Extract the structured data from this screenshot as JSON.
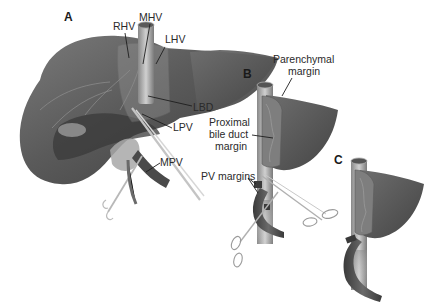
{
  "figure": {
    "panels": [
      {
        "id": "A",
        "label": "A",
        "labels": {
          "rhv": "RHV",
          "mhv": "MHV",
          "lhv": "LHV",
          "lbd": "LBD",
          "lpv": "LPV",
          "mpv": "MPV"
        }
      },
      {
        "id": "B",
        "label": "B",
        "labels": {
          "parenchymal_line1": "Parenchymal",
          "parenchymal_line2": "margin",
          "bile_line1": "Proximal",
          "bile_line2": "bile duct",
          "bile_line3": "margin",
          "pv_margins": "PV margins"
        }
      },
      {
        "id": "C",
        "label": "C"
      }
    ],
    "colors": {
      "liver_dark": "#4a4a4a",
      "liver_mid": "#6a6a6a",
      "liver_light": "#8c8c8c",
      "vessel": "#9a9a9a",
      "vessel_dark": "#3e3e3e",
      "instrument": "#b8b8b8",
      "text": "#2a2a2a"
    }
  }
}
